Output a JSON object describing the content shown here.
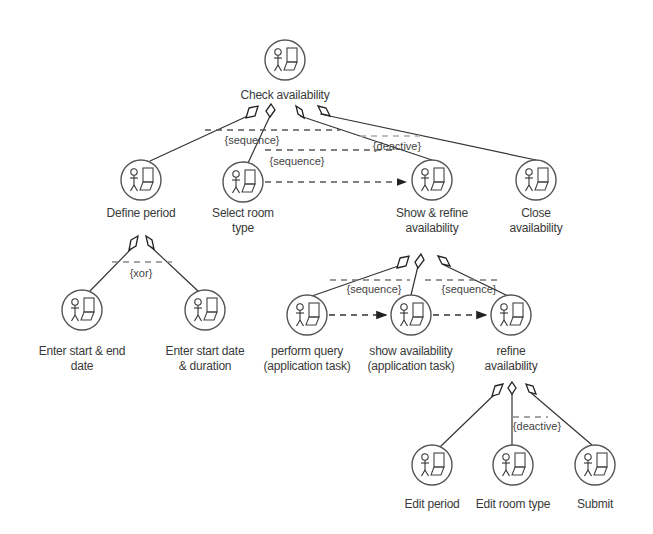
{
  "diagram": {
    "type": "task-tree",
    "nodes": [
      {
        "id": "check",
        "label": "Check availability",
        "x": 285,
        "y": 60,
        "label_y": 88
      },
      {
        "id": "define",
        "label": "Define period",
        "x": 141,
        "y": 180,
        "label_y": 206
      },
      {
        "id": "select",
        "label": "Select room\ntype",
        "x": 243,
        "y": 182,
        "label_y": 206
      },
      {
        "id": "showrefine",
        "label": "Show & refine\navailability",
        "x": 432,
        "y": 180,
        "label_y": 206
      },
      {
        "id": "close",
        "label": "Close\navailability",
        "x": 536,
        "y": 180,
        "label_y": 206
      },
      {
        "id": "enterend",
        "label": "Enter start & end\ndate",
        "x": 82,
        "y": 310,
        "label_y": 344
      },
      {
        "id": "enterdur",
        "label": "Enter start date\n& duration",
        "x": 205,
        "y": 310,
        "label_y": 344
      },
      {
        "id": "query",
        "label": "perform query\n(application task)",
        "x": 307,
        "y": 315,
        "label_y": 344
      },
      {
        "id": "showavail",
        "label": "show availability\n(application task)",
        "x": 411,
        "y": 315,
        "label_y": 344
      },
      {
        "id": "refine",
        "label": "refine\navailability",
        "x": 511,
        "y": 315,
        "label_y": 344
      },
      {
        "id": "editperiod",
        "label": "Edit period",
        "x": 432,
        "y": 465,
        "label_y": 497
      },
      {
        "id": "editroom",
        "label": "Edit room type",
        "x": 513,
        "y": 465,
        "label_y": 497
      },
      {
        "id": "submit",
        "label": "Submit",
        "x": 595,
        "y": 465,
        "label_y": 497
      }
    ],
    "operators": [
      {
        "label": "{sequence}",
        "x": 252,
        "y": 134
      },
      {
        "label": "{sequence}",
        "x": 297,
        "y": 155
      },
      {
        "label": "{deactive}",
        "x": 397,
        "y": 146
      },
      {
        "label": "{xor}",
        "x": 141,
        "y": 267
      },
      {
        "label": "{sequence}",
        "x": 374,
        "y": 286
      },
      {
        "label": "{sequence}",
        "x": 469,
        "y": 286
      },
      {
        "label": "{deactive}",
        "x": 537,
        "y": 424
      }
    ]
  }
}
